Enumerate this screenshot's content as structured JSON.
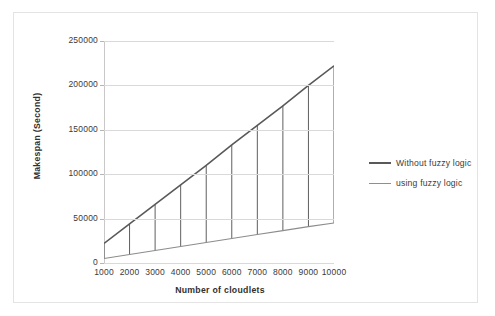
{
  "chart_data": {
    "type": "line",
    "title": "",
    "xlabel": "Number of cloudlets",
    "ylabel": "Makespan (Second)",
    "x": [
      1000,
      2000,
      3000,
      4000,
      5000,
      6000,
      7000,
      8000,
      9000,
      10000
    ],
    "xtick_labels": [
      "1000",
      "2000",
      "3000",
      "4000",
      "5000",
      "6000",
      "7000",
      "8000",
      "9000",
      "10000"
    ],
    "ytick_labels": [
      "0",
      "50000",
      "100000",
      "150000",
      "200000",
      "250000"
    ],
    "yticks": [
      0,
      50000,
      100000,
      150000,
      200000,
      250000
    ],
    "ylim": [
      0,
      250000
    ],
    "xlim": [
      1000,
      10000
    ],
    "grid": "horizontal",
    "legend_position": "right",
    "series": [
      {
        "name": "Without fuzzy logic",
        "color": "#595959",
        "width": 1.6,
        "values": [
          22000,
          44000,
          66000,
          88000,
          110000,
          133000,
          155000,
          177000,
          200000,
          222000
        ]
      },
      {
        "name": "using fuzzy logic",
        "color": "#8c8c8c",
        "width": 1.1,
        "values": [
          5000,
          9500,
          14000,
          18500,
          23000,
          27500,
          32000,
          36500,
          41000,
          45000
        ]
      }
    ],
    "connectors": {
      "name": "vertical-drop-lines",
      "color": "#4d4d4d",
      "description": "vertical lines joining the two series at each cloudlet count"
    }
  },
  "axis": {
    "y_title": "Makespan (Second)",
    "x_title": "Number of cloudlets"
  },
  "legend": {
    "items": [
      {
        "label": "Without fuzzy logic",
        "color": "#595959",
        "thickness": "2.2px"
      },
      {
        "label": "using fuzzy logic",
        "color": "#8f8f8f",
        "thickness": "1.3px"
      }
    ]
  }
}
